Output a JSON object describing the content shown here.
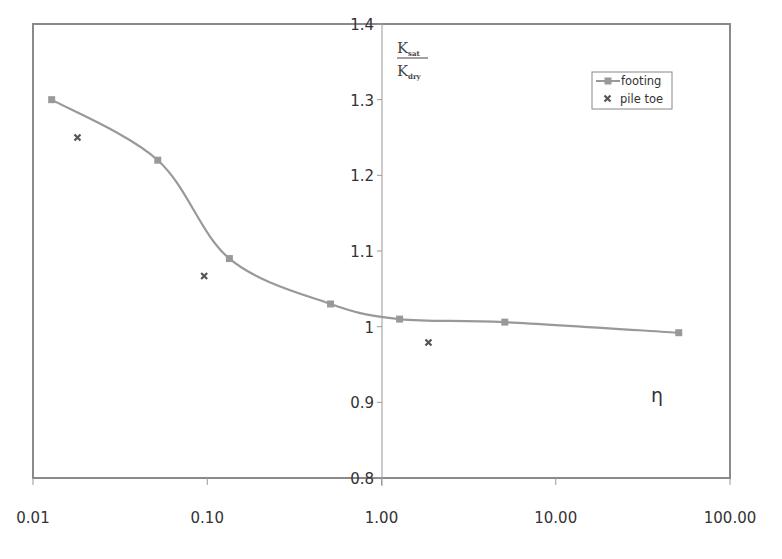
{
  "chart_data": {
    "type": "line",
    "title": "",
    "xlabel": "η",
    "ylabel": "K_sat / K_dry",
    "xscale": "log",
    "xlim": [
      0.01,
      100
    ],
    "ylim": [
      0.8,
      1.4
    ],
    "x_tick_labels": [
      "0.01",
      "0.10",
      "1.00",
      "10.00",
      "100.00"
    ],
    "y_tick_labels": [
      "0.8",
      "0.9",
      "1",
      "1.1",
      "1.2",
      "1.3",
      "1.4"
    ],
    "grid": false,
    "legend_position": "upper right",
    "series": [
      {
        "name": "footing",
        "style": "smooth line with square markers",
        "color": "#999999",
        "x": [
          0.0128,
          0.052,
          0.134,
          0.51,
          1.27,
          5.1,
          50.8
        ],
        "y": [
          1.3,
          1.22,
          1.09,
          1.03,
          1.01,
          1.006,
          0.992
        ]
      },
      {
        "name": "pile toe",
        "style": "markers only (x)",
        "color": "#555555",
        "x": [
          0.018,
          0.096,
          1.86
        ],
        "y": [
          1.25,
          1.067,
          0.979
        ]
      }
    ]
  },
  "labels": {
    "ylabel_num": "K",
    "ylabel_num_sub": "sat",
    "ylabel_den": "K",
    "ylabel_den_sub": "dry",
    "eta": "η",
    "legend_footing": "footing",
    "legend_piletoe": "pile toe"
  }
}
